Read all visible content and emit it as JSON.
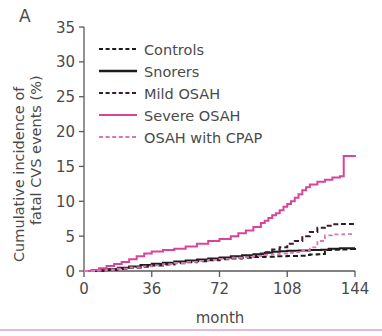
{
  "panel": {
    "label": "A"
  },
  "chart_data": {
    "type": "line",
    "title": "",
    "xlabel": "month",
    "ylabel": "Cumulative incidence of fatal CVS events (%)",
    "ylabel_line1": "Cumulative incidence of",
    "ylabel_line2": "fatal CVS events (%)",
    "xlim": [
      0,
      144
    ],
    "ylim": [
      0,
      35
    ],
    "xticks": [
      0,
      36,
      72,
      108,
      144
    ],
    "xticklabels": [
      "0",
      "36",
      "72",
      "108",
      "144"
    ],
    "yticks": [
      0,
      5,
      10,
      15,
      20,
      25,
      30,
      35
    ],
    "yticklabels": [
      "0",
      "5",
      "10",
      "15",
      "20",
      "25",
      "30",
      "35"
    ],
    "grid": false,
    "legend_position": "upper-left-inside",
    "series": [
      {
        "name": "Controls",
        "color": "#1c1c1c",
        "style": "dashed",
        "dasharray": "5,3",
        "width": 2.0,
        "points": [
          [
            0,
            0
          ],
          [
            6,
            0.05
          ],
          [
            12,
            0.15
          ],
          [
            18,
            0.3
          ],
          [
            24,
            0.45
          ],
          [
            30,
            0.6
          ],
          [
            36,
            0.8
          ],
          [
            42,
            0.95
          ],
          [
            48,
            1.1
          ],
          [
            54,
            1.25
          ],
          [
            60,
            1.4
          ],
          [
            66,
            1.55
          ],
          [
            72,
            1.7
          ],
          [
            78,
            1.8
          ],
          [
            84,
            1.9
          ],
          [
            90,
            2.0
          ],
          [
            96,
            2.05
          ],
          [
            102,
            2.1
          ],
          [
            108,
            2.15
          ],
          [
            114,
            2.2
          ],
          [
            118,
            2.3
          ],
          [
            120,
            2.35
          ],
          [
            124,
            2.4
          ],
          [
            126,
            2.45
          ],
          [
            128,
            3.0
          ],
          [
            132,
            3.05
          ],
          [
            136,
            3.1
          ],
          [
            140,
            3.15
          ],
          [
            144,
            3.2
          ]
        ]
      },
      {
        "name": "Snorers",
        "color": "#1c1c1c",
        "style": "solid",
        "dasharray": "0",
        "width": 2.0,
        "points": [
          [
            0,
            0
          ],
          [
            6,
            0.1
          ],
          [
            12,
            0.25
          ],
          [
            18,
            0.45
          ],
          [
            24,
            0.65
          ],
          [
            30,
            0.85
          ],
          [
            36,
            1.05
          ],
          [
            42,
            1.2
          ],
          [
            48,
            1.35
          ],
          [
            54,
            1.5
          ],
          [
            60,
            1.65
          ],
          [
            66,
            1.8
          ],
          [
            72,
            1.95
          ],
          [
            78,
            2.1
          ],
          [
            84,
            2.25
          ],
          [
            90,
            2.4
          ],
          [
            96,
            2.6
          ],
          [
            100,
            2.75
          ],
          [
            104,
            2.85
          ],
          [
            108,
            2.9
          ],
          [
            114,
            2.95
          ],
          [
            120,
            3.0
          ],
          [
            126,
            3.05
          ],
          [
            130,
            3.2
          ],
          [
            136,
            3.25
          ],
          [
            144,
            3.3
          ]
        ]
      },
      {
        "name": "Mild OSAH",
        "color": "#3a1a2e",
        "style": "dashed",
        "dasharray": "5,3",
        "width": 2.0,
        "points": [
          [
            0,
            0
          ],
          [
            6,
            0.08
          ],
          [
            12,
            0.2
          ],
          [
            18,
            0.38
          ],
          [
            24,
            0.55
          ],
          [
            30,
            0.72
          ],
          [
            36,
            0.9
          ],
          [
            42,
            1.05
          ],
          [
            48,
            1.2
          ],
          [
            54,
            1.35
          ],
          [
            60,
            1.5
          ],
          [
            66,
            1.65
          ],
          [
            72,
            1.8
          ],
          [
            78,
            1.95
          ],
          [
            84,
            2.1
          ],
          [
            90,
            2.25
          ],
          [
            94,
            2.5
          ],
          [
            96,
            2.7
          ],
          [
            100,
            3.1
          ],
          [
            104,
            3.4
          ],
          [
            108,
            3.9
          ],
          [
            112,
            4.3
          ],
          [
            116,
            5.0
          ],
          [
            120,
            5.6
          ],
          [
            124,
            6.2
          ],
          [
            128,
            6.5
          ],
          [
            132,
            6.7
          ],
          [
            136,
            6.75
          ],
          [
            144,
            6.8
          ]
        ]
      },
      {
        "name": "Severe OSAH",
        "color": "#d9449a",
        "style": "solid",
        "dasharray": "0",
        "width": 2.0,
        "points": [
          [
            0,
            0
          ],
          [
            4,
            0.15
          ],
          [
            8,
            0.4
          ],
          [
            12,
            0.7
          ],
          [
            16,
            1.0
          ],
          [
            20,
            1.3
          ],
          [
            24,
            1.7
          ],
          [
            28,
            2.1
          ],
          [
            32,
            2.5
          ],
          [
            36,
            2.8
          ],
          [
            42,
            3.0
          ],
          [
            48,
            3.2
          ],
          [
            54,
            3.5
          ],
          [
            60,
            3.9
          ],
          [
            66,
            4.3
          ],
          [
            72,
            4.6
          ],
          [
            78,
            5.0
          ],
          [
            82,
            5.4
          ],
          [
            86,
            5.8
          ],
          [
            90,
            6.3
          ],
          [
            94,
            6.9
          ],
          [
            96,
            7.2
          ],
          [
            98,
            7.6
          ],
          [
            100,
            8.0
          ],
          [
            102,
            8.3
          ],
          [
            104,
            8.7
          ],
          [
            106,
            9.2
          ],
          [
            108,
            9.6
          ],
          [
            110,
            10.0
          ],
          [
            112,
            10.5
          ],
          [
            114,
            11.0
          ],
          [
            116,
            11.6
          ],
          [
            118,
            12.0
          ],
          [
            120,
            12.4
          ],
          [
            124,
            12.8
          ],
          [
            128,
            13.1
          ],
          [
            132,
            13.4
          ],
          [
            136,
            13.6
          ],
          [
            138,
            16.5
          ],
          [
            144,
            16.6
          ]
        ]
      },
      {
        "name": "OSAH with CPAP",
        "color": "#d978ae",
        "style": "dashed",
        "dasharray": "4,3",
        "width": 1.8,
        "points": [
          [
            0,
            0
          ],
          [
            6,
            0.07
          ],
          [
            12,
            0.18
          ],
          [
            18,
            0.32
          ],
          [
            24,
            0.5
          ],
          [
            30,
            0.65
          ],
          [
            36,
            0.82
          ],
          [
            42,
            0.98
          ],
          [
            48,
            1.15
          ],
          [
            54,
            1.3
          ],
          [
            60,
            1.45
          ],
          [
            66,
            1.6
          ],
          [
            72,
            1.75
          ],
          [
            78,
            1.9
          ],
          [
            84,
            2.0
          ],
          [
            90,
            2.15
          ],
          [
            96,
            2.3
          ],
          [
            100,
            2.4
          ],
          [
            104,
            2.5
          ],
          [
            108,
            2.6
          ],
          [
            112,
            2.7
          ],
          [
            116,
            3.0
          ],
          [
            120,
            3.4
          ],
          [
            124,
            4.3
          ],
          [
            128,
            5.1
          ],
          [
            132,
            5.25
          ],
          [
            138,
            5.3
          ],
          [
            144,
            5.3
          ]
        ]
      }
    ]
  },
  "legend": {
    "items": [
      {
        "label": "Controls",
        "color": "#1c1c1c",
        "dasharray": "4,2.6",
        "width": 2.2
      },
      {
        "label": "Snorers",
        "color": "#1c1c1c",
        "dasharray": "0",
        "width": 2.4
      },
      {
        "label": "Mild OSAH",
        "color": "#3a1a2e",
        "dasharray": "4,2.6",
        "width": 2.2
      },
      {
        "label": "Severe OSAH",
        "color": "#d9449a",
        "dasharray": "0",
        "width": 2.0
      },
      {
        "label": "OSAH with CPAP",
        "color": "#d978ae",
        "dasharray": "4,2.6",
        "width": 2.0
      }
    ]
  },
  "colors": {
    "axis": "#595959",
    "text": "#4a4a4a",
    "accent_pink": "#d9449a",
    "rule": "#e6b9d6"
  }
}
